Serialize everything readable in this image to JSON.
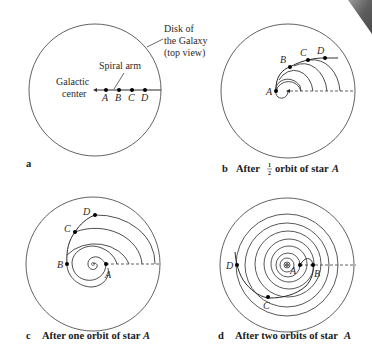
{
  "figure": {
    "panels": [
      {
        "id": "a",
        "caption_letter": "a",
        "caption": "",
        "annotations": {
          "disk": [
            "Disk of",
            "the Galaxy",
            "(top view)"
          ],
          "spiral_arm": "Spiral arm",
          "galactic_center": [
            "Galactic",
            "center"
          ]
        },
        "stars": [
          "A",
          "B",
          "C",
          "D"
        ]
      },
      {
        "id": "b",
        "caption_letter": "b",
        "caption_prefix": "After",
        "fraction_num": "1",
        "fraction_den": "2",
        "caption_suffix": "orbit of star",
        "caption_star": "A",
        "stars": [
          "A",
          "B",
          "C",
          "D"
        ]
      },
      {
        "id": "c",
        "caption_letter": "c",
        "caption": "After one orbit of star",
        "caption_star": "A",
        "stars": [
          "A",
          "B",
          "C",
          "D"
        ]
      },
      {
        "id": "d",
        "caption_letter": "d",
        "caption": "After two orbits of star",
        "caption_star": "A",
        "stars": [
          "A",
          "B",
          "C",
          "D"
        ]
      }
    ],
    "colors": {
      "line": "#3a3a3a",
      "dot": "#000000",
      "corner": "#6b6b6b"
    }
  }
}
